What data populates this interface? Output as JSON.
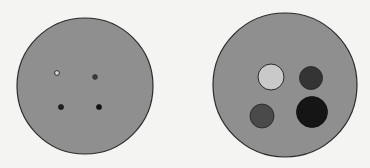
{
  "figure": {
    "colors": {
      "background": "#f4f4f2",
      "disk_fill": "#8f8f8f",
      "disk_stroke": "#2a2a2a"
    },
    "left_disk": {
      "label": "small-spots",
      "spots": [
        {
          "name": "top-left",
          "shade": "#d8d8d8"
        },
        {
          "name": "top-right",
          "shade": "#3a3a3a"
        },
        {
          "name": "bottom-left",
          "shade": "#202020"
        },
        {
          "name": "bottom-right",
          "shade": "#111111"
        }
      ]
    },
    "right_disk": {
      "label": "large-spots",
      "spots": [
        {
          "name": "top-left",
          "shade": "#c9c9c9"
        },
        {
          "name": "top-right",
          "shade": "#343434"
        },
        {
          "name": "bottom-left",
          "shade": "#4a4a4a"
        },
        {
          "name": "bottom-right",
          "shade": "#151515"
        }
      ]
    }
  }
}
